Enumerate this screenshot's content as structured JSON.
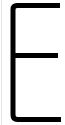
{
  "glyph": {
    "character": "E",
    "color": "#000000"
  },
  "background": "#ffffff",
  "edge_line_color": "#e6e6e6"
}
